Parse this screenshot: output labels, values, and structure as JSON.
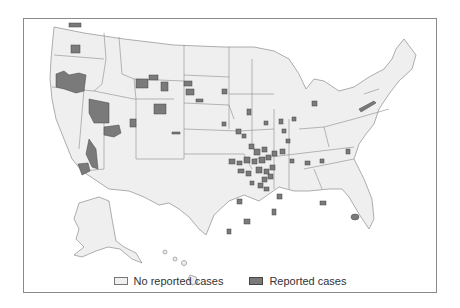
{
  "map": {
    "title": "",
    "region": "United States (counties)",
    "colors": {
      "land": "#efefef",
      "border": "#8c8c8c",
      "reported": "#7a7a7a",
      "reported_border": "#444444",
      "frame": "#8a8a8a"
    }
  },
  "legend": {
    "items": [
      {
        "label": "No reported cases",
        "color": "#efefef"
      },
      {
        "label": "Reported cases",
        "color": "#7a7a7a"
      }
    ]
  }
}
